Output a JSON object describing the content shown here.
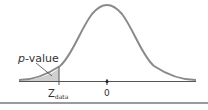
{
  "diagram": {
    "type": "normal-distribution-left-tail",
    "curve_color": "#8a8a8a",
    "shade_color": "#cfcfcf",
    "axis_color": "#555555",
    "labels": {
      "p_value_italic": "p",
      "p_value_rest": "-value",
      "z_main": "Z",
      "z_sub": "data",
      "zero": "0"
    }
  }
}
